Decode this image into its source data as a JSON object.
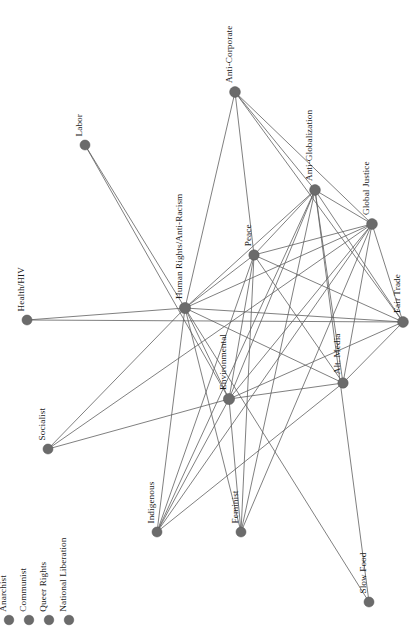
{
  "figure": {
    "kind": "network-graph",
    "background_color": "#ffffff",
    "node_color": "#6b6b6b",
    "edge_color": "#5f5f5f",
    "label_color": "#1a1a1a",
    "label_orientation": "vertical-rotated-90",
    "width": 420,
    "height": 637
  },
  "chart_data": {
    "type": "network",
    "title": "",
    "xlabel": "",
    "ylabel": "",
    "grid": false,
    "legend": "none",
    "node_count": 18,
    "edge_count": 63,
    "nodes": [
      {
        "id": "anti_corporate",
        "label": "Anti-Corporate",
        "x": 235,
        "y": 92,
        "r": 5.4,
        "degree": 5
      },
      {
        "id": "labor",
        "label": "Labor",
        "x": 85,
        "y": 145,
        "r": 5.0,
        "degree": 2
      },
      {
        "id": "anti_globalization",
        "label": "Anti-Globalization",
        "x": 315,
        "y": 190,
        "r": 5.4,
        "degree": 11
      },
      {
        "id": "global_justice",
        "label": "Global Justice",
        "x": 372,
        "y": 224,
        "r": 5.4,
        "degree": 12
      },
      {
        "id": "peace",
        "label": "Peace",
        "x": 254,
        "y": 255,
        "r": 5.2,
        "degree": 11
      },
      {
        "id": "human_rights",
        "label": "Human Rights/Anti-Racism",
        "x": 185,
        "y": 308,
        "r": 5.6,
        "degree": 16
      },
      {
        "id": "health_hiv",
        "label": "Health/HIV",
        "x": 27,
        "y": 320,
        "r": 5.0,
        "degree": 2
      },
      {
        "id": "fair_trade",
        "label": "Fair Trade",
        "x": 403,
        "y": 322,
        "r": 5.4,
        "degree": 9
      },
      {
        "id": "environmental",
        "label": "Environmental",
        "x": 229,
        "y": 399,
        "r": 5.6,
        "degree": 14
      },
      {
        "id": "alt_media",
        "label": "Alt. Media",
        "x": 343,
        "y": 383,
        "r": 5.2,
        "degree": 10
      },
      {
        "id": "socialist",
        "label": "Socialist",
        "x": 48,
        "y": 449,
        "r": 5.0,
        "degree": 2
      },
      {
        "id": "indigenous",
        "label": "Indigenous",
        "x": 157,
        "y": 532,
        "r": 5.0,
        "degree": 4
      },
      {
        "id": "feminist",
        "label": "Feminist",
        "x": 241,
        "y": 532,
        "r": 5.0,
        "degree": 4
      },
      {
        "id": "slow_food",
        "label": "Slow Food",
        "x": 369,
        "y": 602,
        "r": 5.0,
        "degree": 1
      },
      {
        "id": "anarchist",
        "label": "Anarchist",
        "x": 9,
        "y": 620,
        "r": 4.8,
        "degree": 0
      },
      {
        "id": "communist",
        "label": "Communist",
        "x": 29,
        "y": 620,
        "r": 4.8,
        "degree": 0
      },
      {
        "id": "queer_rights",
        "label": "Queer Rights",
        "x": 49,
        "y": 620,
        "r": 4.8,
        "degree": 0
      },
      {
        "id": "national_liberation",
        "label": "National Liberation",
        "x": 69,
        "y": 620,
        "r": 4.8,
        "degree": 0
      }
    ],
    "edges": [
      {
        "source": "anti_corporate",
        "target": "human_rights"
      },
      {
        "source": "anti_corporate",
        "target": "peace"
      },
      {
        "source": "anti_corporate",
        "target": "anti_globalization"
      },
      {
        "source": "anti_corporate",
        "target": "global_justice"
      },
      {
        "source": "anti_corporate",
        "target": "fair_trade"
      },
      {
        "source": "labor",
        "target": "human_rights"
      },
      {
        "source": "labor",
        "target": "environmental"
      },
      {
        "source": "anti_globalization",
        "target": "global_justice"
      },
      {
        "source": "anti_globalization",
        "target": "peace"
      },
      {
        "source": "anti_globalization",
        "target": "human_rights"
      },
      {
        "source": "anti_globalization",
        "target": "fair_trade"
      },
      {
        "source": "anti_globalization",
        "target": "environmental"
      },
      {
        "source": "anti_globalization",
        "target": "alt_media"
      },
      {
        "source": "anti_globalization",
        "target": "feminist"
      },
      {
        "source": "anti_globalization",
        "target": "indigenous"
      },
      {
        "source": "anti_globalization",
        "target": "slow_food"
      },
      {
        "source": "global_justice",
        "target": "peace"
      },
      {
        "source": "global_justice",
        "target": "human_rights"
      },
      {
        "source": "global_justice",
        "target": "fair_trade"
      },
      {
        "source": "global_justice",
        "target": "environmental"
      },
      {
        "source": "global_justice",
        "target": "alt_media"
      },
      {
        "source": "global_justice",
        "target": "feminist"
      },
      {
        "source": "global_justice",
        "target": "indigenous"
      },
      {
        "source": "global_justice",
        "target": "socialist"
      },
      {
        "source": "peace",
        "target": "human_rights"
      },
      {
        "source": "peace",
        "target": "fair_trade"
      },
      {
        "source": "peace",
        "target": "environmental"
      },
      {
        "source": "peace",
        "target": "alt_media"
      },
      {
        "source": "peace",
        "target": "feminist"
      },
      {
        "source": "peace",
        "target": "indigenous"
      },
      {
        "source": "human_rights",
        "target": "health_hiv"
      },
      {
        "source": "human_rights",
        "target": "fair_trade"
      },
      {
        "source": "human_rights",
        "target": "environmental"
      },
      {
        "source": "human_rights",
        "target": "alt_media"
      },
      {
        "source": "human_rights",
        "target": "socialist"
      },
      {
        "source": "human_rights",
        "target": "indigenous"
      },
      {
        "source": "human_rights",
        "target": "feminist"
      },
      {
        "source": "human_rights",
        "target": "slow_food"
      },
      {
        "source": "health_hiv",
        "target": "fair_trade"
      },
      {
        "source": "fair_trade",
        "target": "environmental"
      },
      {
        "source": "fair_trade",
        "target": "alt_media"
      },
      {
        "source": "environmental",
        "target": "alt_media"
      },
      {
        "source": "environmental",
        "target": "indigenous"
      },
      {
        "source": "environmental",
        "target": "feminist"
      },
      {
        "source": "environmental",
        "target": "socialist"
      },
      {
        "source": "alt_media",
        "target": "indigenous"
      }
    ]
  },
  "legend": {
    "visible": true,
    "note": "isolated nodes shown at lower-left",
    "items": [
      {
        "label": "Anarchist"
      },
      {
        "label": "Communist"
      },
      {
        "label": "Queer Rights"
      },
      {
        "label": "National Liberation"
      }
    ]
  }
}
